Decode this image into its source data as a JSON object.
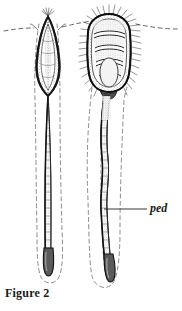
{
  "figure": {
    "caption": "Figure 2",
    "kind": "scientific-line-drawing",
    "background_color": "#ffffff",
    "ink_color": "#1a1a1a",
    "stipple_color": "#4a4a4a",
    "dashed_outline_color": "#6b6b6b",
    "width_px": 182,
    "height_px": 311
  },
  "labels": {
    "ped": {
      "text": "ped",
      "style": "italic",
      "meaning": "peduncle",
      "leader_line": {
        "x1": 104,
        "y1": 209,
        "x2": 146,
        "y2": 209
      }
    }
  },
  "substrate_line": {
    "name": "substrate-surface-line",
    "style": "dashed",
    "y": 28,
    "x_start": 4,
    "x_end": 178
  },
  "specimens": [
    {
      "id": "left-specimen",
      "name": "narrow-spindle-specimen",
      "capitulum": {
        "shape": "narrow lance / spindle",
        "top_y": 16,
        "bottom_y": 95,
        "center_x": 48,
        "max_half_width": 13,
        "texture": "dark margins with stippled pale interior"
      },
      "peduncle": {
        "shape": "straight narrow band",
        "top_y": 95,
        "bottom_y": 272,
        "center_x": 47,
        "half_width": 3
      },
      "burrow_outline": {
        "style": "dashed",
        "description": "elongated dashed envelope flaring below the substrate line and closing in a rounded U at the base"
      },
      "basal_tip": {
        "shape": "rounded dark bulb",
        "y": 272
      }
    },
    {
      "id": "right-specimen",
      "name": "broad-plated-specimen",
      "capitulum": {
        "shape": "broad rounded-rectangular capitulum with overlapping plates",
        "top_y": 15,
        "bottom_y": 92,
        "center_x": 110,
        "max_half_width": 25,
        "plate_count": 4,
        "texture": "stippled plates fringed with radiating setae"
      },
      "setae": {
        "name": "marginal-setae",
        "count": 34,
        "description": "fine bristles radiating from the capitulum margin"
      },
      "peduncle": {
        "shape": "sinuous wavy band",
        "top_y": 92,
        "bottom_y": 283,
        "center_x": 107,
        "half_width": 4
      },
      "burrow_outline": {
        "style": "dashed",
        "description": "dashed envelope following the wavy stalk and closing in a rounded U at the base"
      },
      "basal_tip": {
        "shape": "rounded dark bulb",
        "y": 283
      }
    }
  ]
}
